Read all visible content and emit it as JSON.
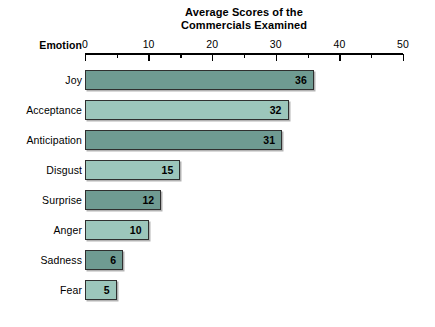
{
  "chart_data": {
    "type": "bar",
    "orientation": "horizontal",
    "title": "Average Scores of the Commercials Examined",
    "title_lines": [
      "Average Scores of the",
      "Commercials Examined"
    ],
    "xlabel": "",
    "ylabel": "Emotion",
    "categories": [
      "Joy",
      "Acceptance",
      "Anticipation",
      "Disgust",
      "Surprise",
      "Anger",
      "Sadness",
      "Fear"
    ],
    "values": [
      36,
      32,
      31,
      15,
      12,
      10,
      6,
      5
    ],
    "value_labels": [
      "36",
      "32",
      "31",
      "15",
      "12",
      "10",
      "6",
      "5"
    ],
    "bar_colors": [
      "#6f9b92",
      "#9cc6bb",
      "#6f9b92",
      "#9cc6bb",
      "#6f9b92",
      "#9cc6bb",
      "#6f9b92",
      "#9cc6bb"
    ],
    "xlim": [
      0,
      50
    ],
    "xticks": [
      0,
      10,
      20,
      30,
      40,
      50
    ],
    "xtick_labels": [
      "0",
      "10",
      "20",
      "30",
      "40",
      "50"
    ],
    "minor_xticks": [
      5,
      15,
      25,
      35,
      45
    ],
    "grid": false,
    "legend": null,
    "colors": {
      "bar_dark": "#6f9b92",
      "bar_light": "#9cc6bb",
      "bar_border": "#2f2f2f",
      "axis": "#000000",
      "background": "#ffffff",
      "text": "#000000"
    }
  }
}
